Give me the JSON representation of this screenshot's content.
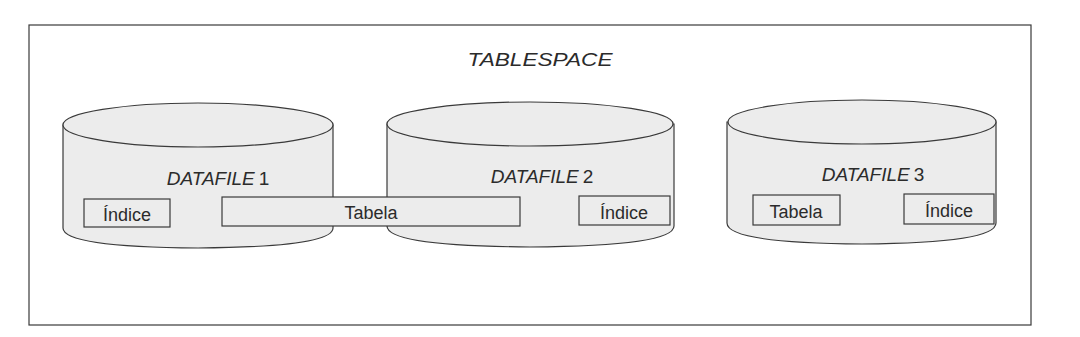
{
  "diagram": {
    "title": "TABLESPACE",
    "colors": {
      "stroke": "#3a3a3a",
      "cylinder_fill": "#ececec",
      "background": "#ffffff",
      "text": "#2b2b2b"
    },
    "datafiles": [
      {
        "label_italic": "DATAFILE",
        "label_num": "1",
        "segments": [
          {
            "label": "Índice"
          }
        ]
      },
      {
        "label_italic": "DATAFILE",
        "label_num": "2",
        "segments": [
          {
            "label": "Índice"
          }
        ]
      },
      {
        "label_italic": "DATAFILE",
        "label_num": "3",
        "segments": [
          {
            "label": "Tabela"
          },
          {
            "label": "Índice"
          }
        ]
      }
    ],
    "spanning_segment": {
      "label": "Tabela",
      "spans": [
        "DATAFILE 1",
        "DATAFILE 2"
      ]
    }
  }
}
